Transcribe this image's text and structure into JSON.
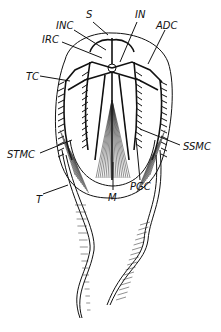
{
  "figure": {
    "labels": [
      {
        "id": "S",
        "text": "S"
      },
      {
        "id": "IN",
        "text": "IN"
      },
      {
        "id": "INC",
        "text": "INC"
      },
      {
        "id": "ADC",
        "text": "ADC"
      },
      {
        "id": "IRC",
        "text": "IRC"
      },
      {
        "id": "TC",
        "text": "TC"
      },
      {
        "id": "STMC",
        "text": "STMC"
      },
      {
        "id": "SSMC",
        "text": "SSMC"
      },
      {
        "id": "PGC",
        "text": "PGC"
      },
      {
        "id": "M",
        "text": "M"
      },
      {
        "id": "T",
        "text": "T"
      }
    ]
  }
}
